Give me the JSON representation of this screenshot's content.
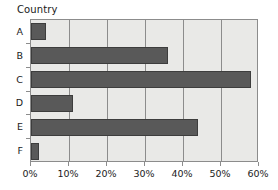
{
  "chart_data": {
    "type": "bar",
    "orientation": "horizontal",
    "title": "",
    "xlabel": "",
    "ylabel": "Country",
    "categories": [
      "A",
      "B",
      "C",
      "D",
      "E",
      "F"
    ],
    "values": [
      4,
      36,
      58,
      11,
      44,
      2
    ],
    "xlim": [
      0,
      60
    ],
    "xticks": [
      0,
      10,
      20,
      30,
      40,
      50,
      60
    ],
    "xtick_labels": [
      "0%",
      "10%",
      "20%",
      "30%",
      "40%",
      "50%",
      "60%"
    ],
    "grid": true,
    "grid_axis": "x",
    "legend": null,
    "series": [
      {
        "name": "",
        "values": [
          4,
          36,
          58,
          11,
          44,
          2
        ]
      }
    ],
    "colors": {
      "bar_fill": "#595959",
      "bar_border": "#3d3d3d",
      "plot_background": "#e9e9e7",
      "axis_line": "#8c8c8c",
      "gridline": "#8c8c8c",
      "text": "#1a1a1a",
      "page_background": "#ffffff"
    }
  },
  "axis": {
    "category_title": "Country"
  }
}
